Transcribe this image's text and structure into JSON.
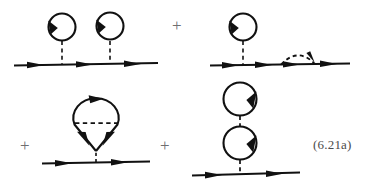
{
  "figure": {
    "kind": "feynman-diagram-equation",
    "equation_label": "(6.21a)",
    "background_color": "#ffffff",
    "ink_color": "#111111",
    "plus_color": "#6f6f6f",
    "label_color": "#4b4b4b",
    "operators": [
      {
        "symbol": "+",
        "name": "plus-1",
        "x": 172,
        "y": 17
      },
      {
        "symbol": "+",
        "name": "plus-2",
        "x": 20,
        "y": 137
      },
      {
        "symbol": "+",
        "name": "plus-3",
        "x": 160,
        "y": 137
      }
    ],
    "terms": [
      {
        "name": "double-tadpole-term",
        "position": "top-left",
        "description": "Propagator line with two tadpole (Hartree) insertions",
        "fermion_line": {
          "y": 64,
          "x_start": 14,
          "x_end": 158
        },
        "line_arrowheads": [
          {
            "x": 38,
            "y": 64,
            "direction": "right"
          },
          {
            "x": 88,
            "y": 64,
            "direction": "right"
          },
          {
            "x": 136,
            "y": 64,
            "direction": "right"
          }
        ],
        "interaction_lines": [
          {
            "style": "dashed",
            "x": 62,
            "y_top": 42,
            "y_bottom": 64
          },
          {
            "style": "dashed",
            "x": 110,
            "y_top": 42,
            "y_bottom": 64
          }
        ],
        "loops": [
          {
            "cx": 62,
            "cy": 27,
            "r": 14,
            "arrow_at": "left",
            "orientation": "counterclockwise"
          },
          {
            "cx": 110,
            "cy": 27,
            "r": 14,
            "arrow_at": "left",
            "orientation": "counterclockwise"
          }
        ]
      },
      {
        "name": "tadpole-plus-rainbow-term",
        "position": "top-right",
        "description": "Propagator line with one tadpole insertion and one dashed self-energy rainbow arc",
        "fermion_line": {
          "y": 64,
          "x_start": 210,
          "x_end": 350
        },
        "line_arrowheads": [
          {
            "x": 232,
            "y": 64,
            "direction": "right"
          },
          {
            "x": 265,
            "y": 64,
            "direction": "right"
          },
          {
            "x": 292,
            "y": 64,
            "direction": "right"
          },
          {
            "x": 332,
            "y": 64,
            "direction": "right"
          }
        ],
        "interaction_lines": [
          {
            "style": "dashed",
            "x": 243,
            "y_top": 42,
            "y_bottom": 64
          }
        ],
        "loops": [
          {
            "cx": 243,
            "cy": 27,
            "r": 14,
            "arrow_at": "left",
            "orientation": "counterclockwise"
          }
        ],
        "arcs": [
          {
            "style": "dashed",
            "x_start": 280,
            "x_end": 315,
            "y": 64,
            "height": 13,
            "arrow_at": "right-descending"
          }
        ]
      },
      {
        "name": "vertex-correction-term",
        "position": "bottom-left",
        "description": "Propagator line with a teardrop vertex-correction loop containing a horizontal dashed interaction",
        "fermion_line": {
          "y": 162,
          "x_start": 42,
          "x_end": 150
        },
        "line_arrowheads": [
          {
            "x": 66,
            "y": 162,
            "direction": "right"
          },
          {
            "x": 122,
            "y": 162,
            "direction": "right"
          }
        ],
        "teardrop": {
          "apex_x": 96,
          "apex_y": 150,
          "cx": 96,
          "cy": 116,
          "rx": 22,
          "ry": 18
        },
        "interaction_lines": [
          {
            "style": "dashed",
            "x1": 76,
            "x2": 116,
            "y": 123,
            "orientation": "horizontal"
          }
        ],
        "loop_arrowheads": [
          {
            "x": 99,
            "y": 98,
            "direction": "right",
            "position": "top-of-loop"
          },
          {
            "x": 83,
            "y": 140,
            "direction": "down-left",
            "position": "lower-left-leg"
          },
          {
            "x": 109,
            "y": 140,
            "direction": "down-right",
            "position": "lower-right-leg"
          }
        ]
      },
      {
        "name": "stacked-loops-term",
        "position": "bottom-right",
        "description": "Propagator line with two vertically stacked fermion loops joined by dashed interaction lines",
        "fermion_line": {
          "y": 173,
          "x_start": 192,
          "x_end": 300
        },
        "line_arrowheads": [
          {
            "x": 216,
            "y": 173,
            "direction": "right"
          },
          {
            "x": 277,
            "y": 173,
            "direction": "right"
          }
        ],
        "loops": [
          {
            "cx": 240,
            "cy": 99,
            "r": 17,
            "arrow_at": "right",
            "orientation": "clockwise"
          },
          {
            "cx": 240,
            "cy": 143,
            "r": 17,
            "arrow_at": "right",
            "orientation": "clockwise"
          }
        ],
        "interaction_lines": [
          {
            "style": "dashed",
            "x": 240,
            "y_top": 116,
            "y_bottom": 126
          },
          {
            "style": "dashed",
            "x": 240,
            "y_top": 160,
            "y_bottom": 173
          }
        ]
      }
    ]
  }
}
